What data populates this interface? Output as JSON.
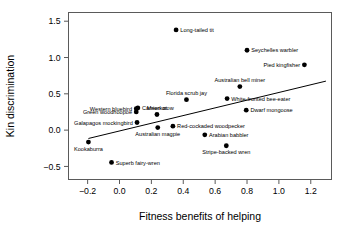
{
  "chart_data": {
    "type": "scatter",
    "title": "",
    "xlabel": "Fitness benefits of helping",
    "ylabel": "Kin discrimination",
    "xlim": [
      -0.32,
      1.33
    ],
    "ylim": [
      -0.68,
      1.62
    ],
    "xticks": [
      -0.2,
      0.0,
      0.2,
      0.4,
      0.6,
      0.8,
      1.0,
      1.2
    ],
    "xticklabels": [
      "−0.2",
      "0.0",
      "0.2",
      "0.4",
      "0.6",
      "0.8",
      "1.0",
      "1.2"
    ],
    "yticks": [
      -0.5,
      0.0,
      0.5,
      1.0,
      1.5
    ],
    "yticklabels": [
      "−0.5",
      "0.0",
      "0.5",
      "1.0",
      "1.5"
    ],
    "grid": false,
    "legend": "none",
    "point_color": "#000000",
    "line_color": "#000000",
    "points": [
      {
        "label": "Long-tailed tit",
        "x": 0.355,
        "y": 1.38,
        "label_pos": "right"
      },
      {
        "label": "Seychelles warbler",
        "x": 0.8,
        "y": 1.1,
        "label_pos": "right"
      },
      {
        "label": "Pied kingfisher",
        "x": 1.16,
        "y": 0.9,
        "label_pos": "left"
      },
      {
        "label": "Australian bell miner",
        "x": 0.755,
        "y": 0.6,
        "label_pos": "above"
      },
      {
        "label": "Florida scrub jay",
        "x": 0.42,
        "y": 0.42,
        "label_pos": "above"
      },
      {
        "label": "White-fronted bee-eater",
        "x": 0.675,
        "y": 0.435,
        "label_pos": "right"
      },
      {
        "label": "Carrion crow",
        "x": 0.115,
        "y": 0.305,
        "label_pos": "right"
      },
      {
        "label": "Western bluebird",
        "x": 0.105,
        "y": 0.295,
        "label_pos": "left"
      },
      {
        "label": "Dwarf mongoose",
        "x": 0.795,
        "y": 0.275,
        "label_pos": "right"
      },
      {
        "label": "Green woodhoopoe",
        "x": 0.105,
        "y": 0.25,
        "label_pos": "left"
      },
      {
        "label": "Meerkat",
        "x": 0.235,
        "y": 0.215,
        "label_pos": "above"
      },
      {
        "label": "Galapagos mockingbird",
        "x": 0.11,
        "y": 0.105,
        "label_pos": "left"
      },
      {
        "label": "Red-cockaded woodpecker",
        "x": 0.335,
        "y": 0.055,
        "label_pos": "right"
      },
      {
        "label": "Australian magpie",
        "x": 0.24,
        "y": 0.035,
        "label_pos": "below"
      },
      {
        "label": "Arabian babbler",
        "x": 0.535,
        "y": -0.065,
        "label_pos": "right"
      },
      {
        "label": "Kookaburra",
        "x": -0.195,
        "y": -0.165,
        "label_pos": "below"
      },
      {
        "label": "Stripe-backed wren",
        "x": 0.67,
        "y": -0.215,
        "label_pos": "below"
      },
      {
        "label": "Superb fairy-wren",
        "x": -0.05,
        "y": -0.445,
        "label_pos": "right"
      }
    ],
    "fit_line": {
      "x1": -0.195,
      "y1": -0.115,
      "x2": 1.295,
      "y2": 0.675
    }
  }
}
